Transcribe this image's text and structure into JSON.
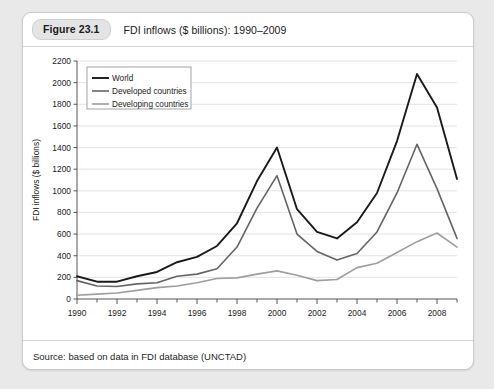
{
  "figure": {
    "number": "Figure 23.1",
    "title": "FDI inflows ($ billions): 1990–2009",
    "source": "Source: based on data in FDI database (UNCTAD)"
  },
  "chart_data": {
    "type": "line",
    "title": "FDI inflows ($ billions): 1990–2009",
    "xlabel": "",
    "ylabel": "FDI inflows ($ billions)",
    "xlim": [
      1990,
      2009
    ],
    "ylim": [
      0,
      2200
    ],
    "ytick_step": 200,
    "grid": "horizontal",
    "legend_position": "top-left",
    "x": [
      1990,
      1991,
      1992,
      1993,
      1994,
      1995,
      1996,
      1997,
      1998,
      1999,
      2000,
      2001,
      2002,
      2003,
      2004,
      2005,
      2006,
      2007,
      2008,
      2009
    ],
    "xtick_labels": [
      "1990",
      "1992",
      "1994",
      "1996",
      "1998",
      "2000",
      "2002",
      "2004",
      "2006",
      "2008"
    ],
    "xtick_values": [
      1990,
      1992,
      1994,
      1996,
      1998,
      2000,
      2002,
      2004,
      2006,
      2008
    ],
    "ytick_labels": [
      "0",
      "200",
      "400",
      "600",
      "800",
      "1000",
      "1200",
      "1400",
      "1600",
      "1800",
      "2000",
      "2200"
    ],
    "ytick_values": [
      0,
      200,
      400,
      600,
      800,
      1000,
      1200,
      1400,
      1600,
      1800,
      2000,
      2200
    ],
    "series": [
      {
        "name": "World",
        "color": "#1a1a1a",
        "width": 1.9,
        "values": [
          210,
          160,
          160,
          210,
          250,
          340,
          390,
          490,
          700,
          1090,
          1400,
          830,
          620,
          560,
          710,
          980,
          1460,
          2080,
          1770,
          1110
        ]
      },
      {
        "name": "Developed countries",
        "color": "#646464",
        "width": 1.6,
        "values": [
          170,
          120,
          115,
          140,
          150,
          210,
          230,
          280,
          480,
          840,
          1140,
          600,
          440,
          360,
          420,
          620,
          980,
          1430,
          1020,
          560
        ]
      },
      {
        "name": "Developing countries",
        "color": "#9e9e9e",
        "width": 1.6,
        "values": [
          35,
          45,
          55,
          80,
          105,
          120,
          150,
          190,
          195,
          230,
          260,
          220,
          170,
          180,
          290,
          330,
          430,
          530,
          610,
          480
        ]
      }
    ]
  }
}
